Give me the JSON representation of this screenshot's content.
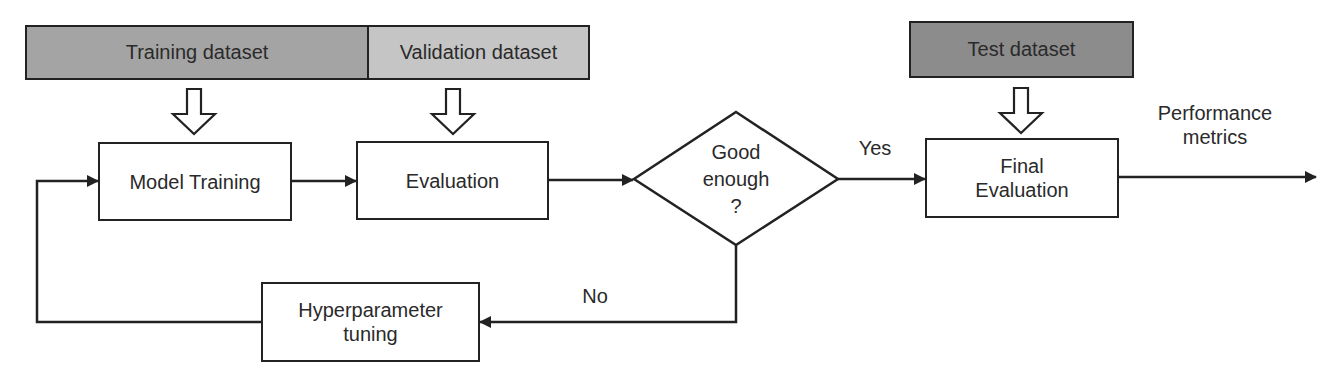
{
  "diagram": {
    "colors": {
      "training_dataset": "#a4a4a4",
      "validation_dataset": "#c5c5c5",
      "test_dataset": "#8c8c8c",
      "stroke": "#222222",
      "box_fill": "#ffffff"
    },
    "datasets": {
      "training": "Training dataset",
      "validation": "Validation dataset",
      "test": "Test dataset"
    },
    "nodes": {
      "model_training": "Model Training",
      "evaluation": "Evaluation",
      "decision": {
        "line1": "Good",
        "line2": "enough",
        "line3": "?"
      },
      "final_evaluation": {
        "line1": "Final",
        "line2": "Evaluation"
      },
      "hyperparameter_tuning": {
        "line1": "Hyperparameter",
        "line2": "tuning"
      }
    },
    "edge_labels": {
      "yes": "Yes",
      "no": "No",
      "output": {
        "line1": "Performance",
        "line2": "metrics"
      }
    },
    "edges": [
      {
        "from": "training_dataset",
        "to": "model_training",
        "style": "hollow-arrow"
      },
      {
        "from": "validation_dataset",
        "to": "evaluation",
        "style": "hollow-arrow"
      },
      {
        "from": "test_dataset",
        "to": "final_evaluation",
        "style": "hollow-arrow"
      },
      {
        "from": "model_training",
        "to": "evaluation"
      },
      {
        "from": "evaluation",
        "to": "decision"
      },
      {
        "from": "decision",
        "to": "final_evaluation",
        "label": "Yes"
      },
      {
        "from": "decision",
        "to": "hyperparameter_tuning",
        "label": "No"
      },
      {
        "from": "hyperparameter_tuning",
        "to": "model_training"
      },
      {
        "from": "final_evaluation",
        "to": "output",
        "label": "Performance metrics"
      }
    ]
  }
}
